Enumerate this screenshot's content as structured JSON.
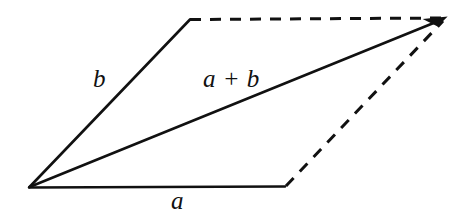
{
  "figure": {
    "name": "vector-addition-parallelogram",
    "background_color": "#ffffff",
    "stroke_color": "#111111",
    "width": 472,
    "height": 216
  },
  "labels": {
    "vector_b": "b",
    "vector_a": "a",
    "vector_sum": "a + b"
  },
  "chart_data": {
    "type": "diagram",
    "title": "",
    "subtitle": "",
    "xlabel": "",
    "ylabel": "",
    "grid": false,
    "legend": null,
    "coordinate_space": {
      "width": 472,
      "height": 216,
      "origin": "top-left-pixels"
    },
    "points": {
      "origin": [
        29,
        187
      ],
      "tip_a": [
        285,
        187
      ],
      "tip_b": [
        190,
        19
      ],
      "tip_sum": [
        445,
        19
      ]
    },
    "segments": [
      {
        "name": "vector-a",
        "label": "a",
        "style": "solid",
        "arrowhead": false,
        "from": [
          29,
          187
        ],
        "to": [
          285,
          187
        ],
        "stroke_width": 2.4,
        "color": "#111111"
      },
      {
        "name": "vector-b",
        "label": "b",
        "style": "solid",
        "arrowhead": false,
        "from": [
          29,
          187
        ],
        "to": [
          190,
          19
        ],
        "stroke_width": 2.4,
        "color": "#111111"
      },
      {
        "name": "vector-sum",
        "label": "a + b",
        "style": "solid",
        "arrowhead": true,
        "from": [
          29,
          187
        ],
        "to": [
          445,
          19
        ],
        "stroke_width": 2.4,
        "color": "#111111"
      },
      {
        "name": "dashed-top-edge",
        "label": "",
        "style": "dashed",
        "arrowhead": false,
        "from": [
          190,
          19
        ],
        "to": [
          445,
          19
        ],
        "stroke_width": 3,
        "dash_pattern": "11 9",
        "color": "#111111"
      },
      {
        "name": "dashed-right-edge",
        "label": "",
        "style": "dashed",
        "arrowhead": false,
        "from": [
          285,
          187
        ],
        "to": [
          445,
          19
        ],
        "stroke_width": 3,
        "dash_pattern": "11 9",
        "color": "#111111"
      }
    ],
    "label_positions": {
      "vector_b": [
        103,
        82
      ],
      "vector_a": [
        180,
        204
      ],
      "vector_sum": [
        234,
        82
      ]
    }
  }
}
